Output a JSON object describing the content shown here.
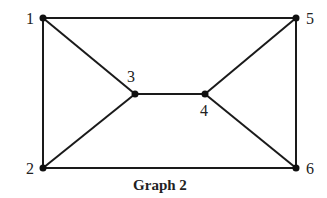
{
  "graph": {
    "caption": "Graph 2",
    "nodes": [
      {
        "id": "1",
        "label": "1",
        "x": 43,
        "y": 18,
        "lx": 26,
        "ly": 24
      },
      {
        "id": "2",
        "label": "2",
        "x": 43,
        "y": 168,
        "lx": 26,
        "ly": 174
      },
      {
        "id": "3",
        "label": "3",
        "x": 135,
        "y": 94,
        "lx": 127,
        "ly": 82
      },
      {
        "id": "4",
        "label": "4",
        "x": 205,
        "y": 94,
        "lx": 200,
        "ly": 116
      },
      {
        "id": "5",
        "label": "5",
        "x": 296,
        "y": 18,
        "lx": 306,
        "ly": 24
      },
      {
        "id": "6",
        "label": "6",
        "x": 296,
        "y": 168,
        "lx": 306,
        "ly": 174
      }
    ],
    "edges": [
      [
        "1",
        "5"
      ],
      [
        "1",
        "2"
      ],
      [
        "1",
        "3"
      ],
      [
        "2",
        "3"
      ],
      [
        "2",
        "6"
      ],
      [
        "3",
        "4"
      ],
      [
        "4",
        "5"
      ],
      [
        "4",
        "6"
      ],
      [
        "5",
        "6"
      ]
    ],
    "colors": {
      "edge": "#1a1a1a",
      "node": "#111111"
    }
  }
}
